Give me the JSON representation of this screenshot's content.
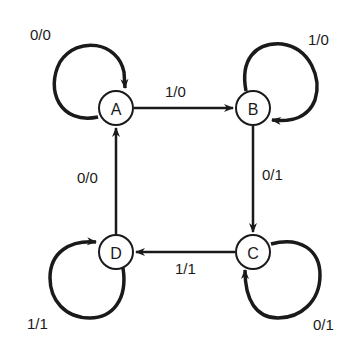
{
  "diagram": {
    "type": "state-transition",
    "nodes": [
      {
        "id": "A",
        "label": "A"
      },
      {
        "id": "B",
        "label": "B"
      },
      {
        "id": "C",
        "label": "C"
      },
      {
        "id": "D",
        "label": "D"
      }
    ],
    "edges": [
      {
        "from": "A",
        "to": "A",
        "label": "0/0"
      },
      {
        "from": "A",
        "to": "B",
        "label": "1/0"
      },
      {
        "from": "B",
        "to": "B",
        "label": "1/0"
      },
      {
        "from": "B",
        "to": "C",
        "label": "0/1"
      },
      {
        "from": "C",
        "to": "C",
        "label": "0/1"
      },
      {
        "from": "C",
        "to": "D",
        "label": "1/1"
      },
      {
        "from": "D",
        "to": "D",
        "label": "1/1"
      },
      {
        "from": "D",
        "to": "A",
        "label": "0/0"
      }
    ]
  }
}
